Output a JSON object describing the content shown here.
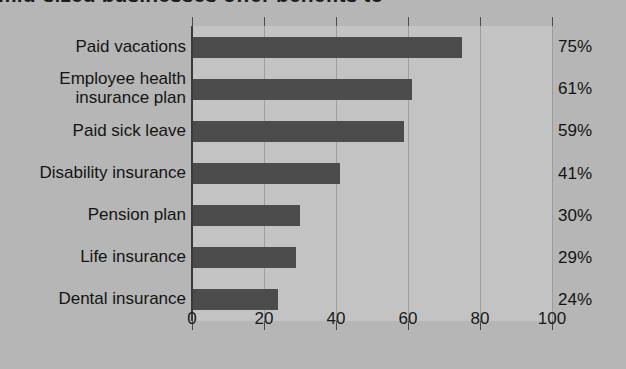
{
  "title": "mid-sized businesses offer benefits to",
  "colors": {
    "background": "#b6b6b6",
    "plot_background": "#c3c3c3",
    "bar": "#4c4c4c",
    "axis": "#3a3a3a",
    "text": "#141414"
  },
  "chart_data": {
    "type": "bar",
    "orientation": "horizontal",
    "title": "mid-sized businesses offer benefits to",
    "xlabel": "",
    "ylabel": "",
    "xlim": [
      0,
      100
    ],
    "xticks": [
      0,
      20,
      40,
      60,
      80,
      100
    ],
    "xtick_labels": [
      "0",
      "20",
      "40",
      "60",
      "80",
      "100"
    ],
    "grid": true,
    "legend": false,
    "categories": [
      "Paid vacations",
      "Employee health\ninsurance plan",
      "Paid sick leave",
      "Disability insurance",
      "Pension plan",
      "Life insurance",
      "Dental insurance"
    ],
    "values": [
      75,
      61,
      59,
      41,
      30,
      29,
      24
    ],
    "data_labels": [
      "75%",
      "61%",
      "59%",
      "41%",
      "30%",
      "29%",
      "24%"
    ]
  },
  "axis": {
    "ticks": [
      {
        "value": 0,
        "label": "0"
      },
      {
        "value": 20,
        "label": "20"
      },
      {
        "value": 40,
        "label": "40"
      },
      {
        "value": 60,
        "label": "60"
      },
      {
        "value": 80,
        "label": "80"
      },
      {
        "value": 100,
        "label": "100"
      }
    ]
  },
  "rows": [
    {
      "label": "Paid vacations",
      "value": 75,
      "value_label": "75%"
    },
    {
      "label": "Employee health\ninsurance plan",
      "value": 61,
      "value_label": "61%"
    },
    {
      "label": "Paid sick leave",
      "value": 59,
      "value_label": "59%"
    },
    {
      "label": "Disability insurance",
      "value": 41,
      "value_label": "41%"
    },
    {
      "label": "Pension plan",
      "value": 30,
      "value_label": "30%"
    },
    {
      "label": "Life insurance",
      "value": 29,
      "value_label": "29%"
    },
    {
      "label": "Dental insurance",
      "value": 24,
      "value_label": "24%"
    }
  ]
}
